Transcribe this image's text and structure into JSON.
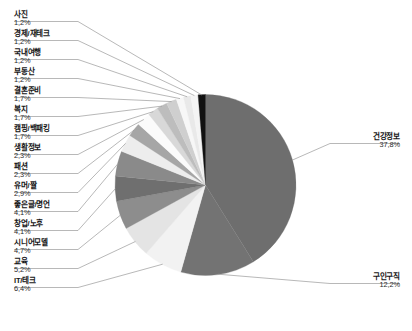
{
  "chart_data": {
    "type": "pie",
    "title": "",
    "subtitle": "",
    "xlabel": "",
    "ylabel": "",
    "legend_position": "none",
    "grid": false,
    "unit": "%",
    "total": 100.0,
    "start_angle_deg": 0,
    "direction": "clockwise",
    "categories": [
      "건강정보",
      "구인구직",
      "IT/테크",
      "교육",
      "시니어모델",
      "창업/노후",
      "좋은글/명언",
      "유머/짤",
      "패션",
      "생활정보",
      "캠핑/백패킹",
      "복지",
      "결혼준비",
      "부동산",
      "국내여행",
      "경제/재테크",
      "사진"
    ],
    "values": [
      37.8,
      12.2,
      6.4,
      5.2,
      4.7,
      4.1,
      4.1,
      2.9,
      2.3,
      2.3,
      1.7,
      1.7,
      1.7,
      1.2,
      1.2,
      1.2,
      1.2
    ],
    "colors": [
      "#6e6e6e",
      "#737373",
      "#f2f2f2",
      "#e4e4e4",
      "#8d8d8d",
      "#6f6f6f",
      "#8a8a8a",
      "#ededed",
      "#a6a6a6",
      "#fbfbfb",
      "#d8d8d8",
      "#bdbdbd",
      "#cfcfcf",
      "#f7f7f7",
      "#e9e9e9",
      "#f4f4f4",
      "#111111"
    ],
    "slices": [
      {
        "label": "건강정보",
        "value": 37.8,
        "display": "37,8%",
        "color": "#6e6e6e"
      },
      {
        "label": "구인구직",
        "value": 12.2,
        "display": "12,2%",
        "color": "#737373"
      },
      {
        "label": "IT/테크",
        "value": 6.4,
        "display": "6,4%",
        "color": "#f2f2f2"
      },
      {
        "label": "교육",
        "value": 5.2,
        "display": "5,2%",
        "color": "#e4e4e4"
      },
      {
        "label": "시니어모델",
        "value": 4.7,
        "display": "4,7%",
        "color": "#8d8d8d"
      },
      {
        "label": "창업/노후",
        "value": 4.1,
        "display": "4,1%",
        "color": "#6f6f6f"
      },
      {
        "label": "좋은글/명언",
        "value": 4.1,
        "display": "4,1%",
        "color": "#8a8a8a"
      },
      {
        "label": "유머/짤",
        "value": 2.9,
        "display": "2,9%",
        "color": "#ededed"
      },
      {
        "label": "패션",
        "value": 2.3,
        "display": "2,3%",
        "color": "#a6a6a6"
      },
      {
        "label": "생활정보",
        "value": 2.3,
        "display": "2,3%",
        "color": "#fbfbfb"
      },
      {
        "label": "캠핑/백패킹",
        "value": 1.7,
        "display": "1,7%",
        "color": "#d8d8d8"
      },
      {
        "label": "복지",
        "value": 1.7,
        "display": "1,7%",
        "color": "#bdbdbd"
      },
      {
        "label": "결혼준비",
        "value": 1.7,
        "display": "1,7%",
        "color": "#cfcfcf"
      },
      {
        "label": "부동산",
        "value": 1.2,
        "display": "1,2%",
        "color": "#f7f7f7"
      },
      {
        "label": "국내여행",
        "value": 1.2,
        "display": "1,2%",
        "color": "#e9e9e9"
      },
      {
        "label": "경제/재테크",
        "value": 1.2,
        "display": "1,2%",
        "color": "#f4f4f4"
      },
      {
        "label": "사진",
        "value": 1.2,
        "display": "1,2%",
        "color": "#111111"
      }
    ]
  },
  "labels": {
    "left": [
      {
        "name": "사진",
        "pct": "1,2%"
      },
      {
        "name": "경제/재테크",
        "pct": "1,2%"
      },
      {
        "name": "국내여행",
        "pct": "1,2%"
      },
      {
        "name": "부동산",
        "pct": "1,2%"
      },
      {
        "name": "결혼준비",
        "pct": "1,7%"
      },
      {
        "name": "복지",
        "pct": "1,7%"
      },
      {
        "name": "캠핑/백패킹",
        "pct": "1,7%"
      },
      {
        "name": "생활정보",
        "pct": "2,3%"
      },
      {
        "name": "패션",
        "pct": "2,3%"
      },
      {
        "name": "유머/짤",
        "pct": "2,9%"
      },
      {
        "name": "좋은글/명언",
        "pct": "4,1%"
      },
      {
        "name": "창업/노후",
        "pct": "4,1%"
      },
      {
        "name": "시니어모델",
        "pct": "4,7%"
      },
      {
        "name": "교육",
        "pct": "5,2%"
      },
      {
        "name": "IT/테크",
        "pct": "6,4%"
      }
    ],
    "right": [
      {
        "name": "건강정보",
        "pct": "37,8%"
      },
      {
        "name": "구인구직",
        "pct": "12,2%"
      }
    ]
  }
}
